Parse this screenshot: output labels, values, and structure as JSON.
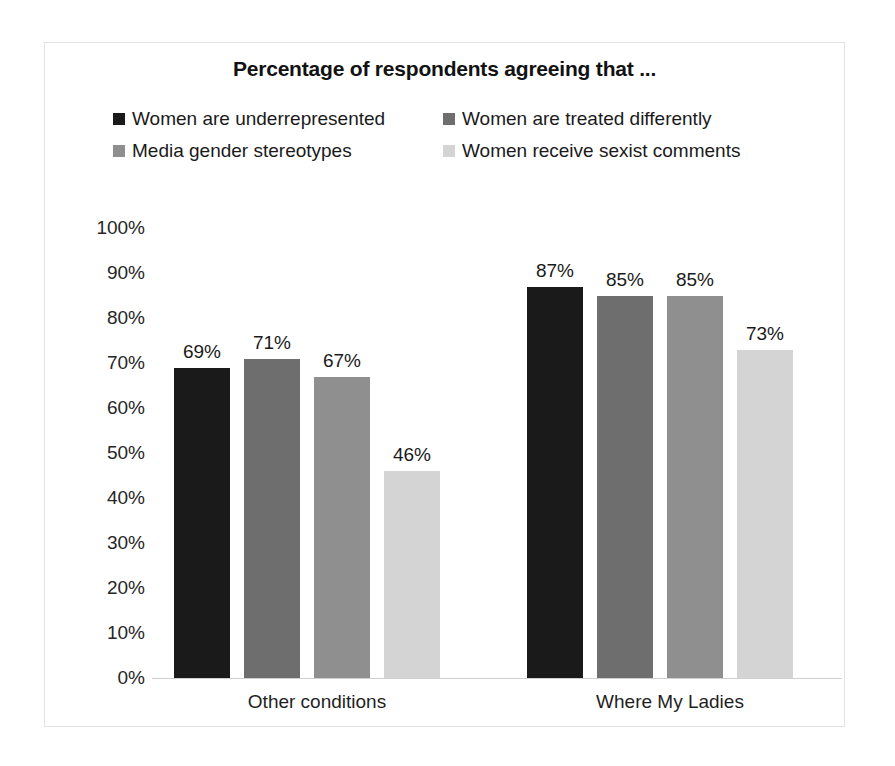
{
  "chart_data": {
    "type": "bar",
    "title": "Percentage of respondents agreeing that ...",
    "xlabel": "",
    "ylabel": "",
    "ylim": [
      0,
      100
    ],
    "ytick_labels": [
      "100%",
      "90%",
      "80%",
      "70%",
      "60%",
      "50%",
      "40%",
      "30%",
      "20%",
      "10%",
      "0%"
    ],
    "ytick_values": [
      100,
      90,
      80,
      70,
      60,
      50,
      40,
      30,
      20,
      10,
      0
    ],
    "grid": false,
    "legend_position": "top",
    "categories": [
      "Other conditions",
      "Where My Ladies"
    ],
    "series": [
      {
        "name": "Women are underrepresented",
        "color": "#1a1a1a",
        "values": [
          69,
          87
        ],
        "labels": [
          "69%",
          "87%"
        ]
      },
      {
        "name": "Women are treated differently",
        "color": "#6e6e6e",
        "values": [
          71,
          85
        ],
        "labels": [
          "71%",
          "85%"
        ]
      },
      {
        "name": "Media gender stereotypes",
        "color": "#8f8f8f",
        "values": [
          67,
          85
        ],
        "labels": [
          "67%",
          "85%"
        ]
      },
      {
        "name": "Women receive sexist comments",
        "color": "#d4d4d4",
        "values": [
          46,
          73
        ],
        "labels": [
          "46%",
          "73%"
        ]
      }
    ]
  }
}
